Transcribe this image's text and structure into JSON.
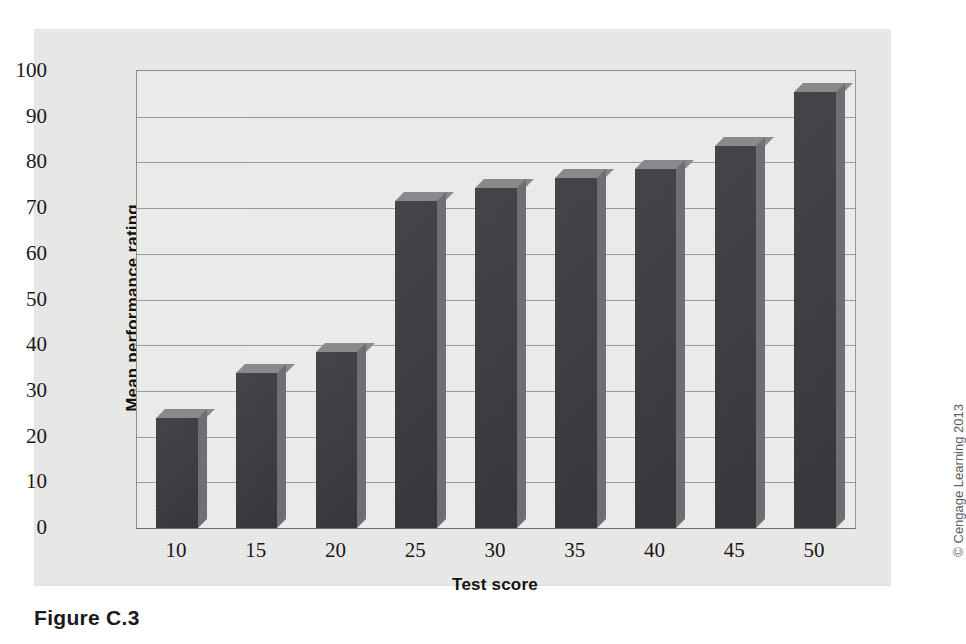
{
  "figure": {
    "caption": "Figure C.3",
    "credit": "© Cengage Learning 2013"
  },
  "colors": {
    "page_background": "#ffffff",
    "panel_background": "#e9e9e7",
    "plot_background": "#ececea",
    "bar_front": "#3b3b40",
    "bar_top": "#8b8b8e",
    "bar_side": "#6f6f74",
    "gridline": "#9b9b9b",
    "axis": "#6f6f6f",
    "text": "#181818"
  },
  "chart_data": {
    "type": "bar",
    "title": "",
    "xlabel": "Test score",
    "ylabel": "Mean performance rating",
    "categories": [
      "10",
      "15",
      "20",
      "25",
      "30",
      "35",
      "40",
      "45",
      "50"
    ],
    "values": [
      24,
      34,
      38.5,
      71.5,
      74.5,
      76.5,
      78.5,
      83.5,
      95.5
    ],
    "ylim": [
      0,
      100
    ],
    "yticks": [
      "100",
      "90",
      "80",
      "70",
      "60",
      "50",
      "40",
      "30",
      "20",
      "10",
      "0"
    ],
    "ytick_values": [
      100,
      90,
      80,
      70,
      60,
      50,
      40,
      30,
      20,
      10,
      0
    ],
    "grid": "horizontal",
    "legend": "none",
    "style": "3d-extruded-bars"
  }
}
